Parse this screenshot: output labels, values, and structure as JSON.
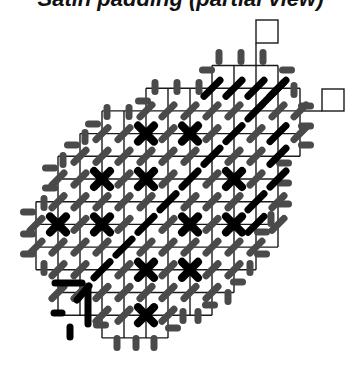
{
  "title": "Satin padding (partial view)",
  "colors": {
    "grid_line": "#1a1a1a",
    "grey_stitch": "#4a4a4a",
    "black_stitch": "#000000",
    "background": "#ffffff"
  },
  "grid": {
    "x0": 36,
    "col_w": 22,
    "y0": 65.5,
    "row_h": 22.7,
    "rows": [
      {
        "c0": 8,
        "c1": 11
      },
      {
        "c0": 5,
        "c1": 12
      },
      {
        "c0": 3,
        "c1": 12
      },
      {
        "c0": 2,
        "c1": 12
      },
      {
        "c0": 1,
        "c1": 11
      },
      {
        "c0": 1,
        "c1": 11
      },
      {
        "c0": 0,
        "c1": 11
      },
      {
        "c0": 0,
        "c1": 11
      },
      {
        "c0": 0,
        "c1": 10
      },
      {
        "c0": 1,
        "c1": 9
      },
      {
        "c0": 1,
        "c1": 8
      },
      {
        "c0": 3,
        "c1": 6
      }
    ]
  },
  "flags": [
    {
      "name": "flag-box-top",
      "x": 256,
      "y": 20,
      "w": 22,
      "h": 23,
      "line": [
        256,
        43,
        256,
        65
      ]
    },
    {
      "name": "flag-box-right",
      "x": 322,
      "y": 89,
      "w": 22,
      "h": 22,
      "line": [
        300,
        111,
        322,
        111
      ]
    }
  ],
  "crosses": [
    [
      5,
      3
    ],
    [
      7,
      3
    ],
    [
      3,
      5
    ],
    [
      5,
      5
    ],
    [
      9,
      5
    ],
    [
      1,
      7
    ],
    [
      3,
      7
    ],
    [
      7,
      7
    ],
    [
      9,
      7
    ],
    [
      5,
      9
    ],
    [
      7,
      9
    ],
    [
      5,
      11
    ]
  ],
  "black_slashes": [
    [
      8,
      1
    ],
    [
      9,
      1
    ],
    [
      10,
      1
    ],
    [
      11,
      1
    ],
    [
      9,
      3
    ],
    [
      11,
      3
    ],
    [
      8,
      4
    ],
    [
      11,
      4
    ],
    [
      7,
      5
    ],
    [
      11,
      5
    ],
    [
      6,
      6
    ],
    [
      10,
      6
    ],
    [
      5,
      7
    ],
    [
      10,
      7
    ],
    [
      4,
      8
    ],
    [
      3,
      9
    ]
  ],
  "long_black_diagonal": [
    [
      10,
      2
    ],
    [
      11,
      1
    ]
  ],
  "hook_mark": {
    "horizontal": [
      [
        55,
        283
      ],
      [
        82,
        283
      ]
    ],
    "diagonal": [
      [
        77,
        300
      ],
      [
        89,
        286
      ]
    ],
    "vertical": [
      [
        88,
        288
      ],
      [
        88,
        324
      ]
    ],
    "short_dash": [
      [
        54,
        313
      ],
      [
        62,
        313
      ]
    ],
    "short_vert": [
      [
        70,
        327
      ],
      [
        70,
        337
      ]
    ]
  },
  "edge_stitches": [
    {
      "x": 219,
      "y": 57,
      "o": "v"
    },
    {
      "x": 241,
      "y": 57,
      "o": "v"
    },
    {
      "x": 263,
      "y": 57,
      "o": "v"
    },
    {
      "x": 207,
      "y": 70,
      "o": "h"
    },
    {
      "x": 287,
      "y": 70,
      "o": "h"
    },
    {
      "x": 155,
      "y": 87,
      "o": "v"
    },
    {
      "x": 177,
      "y": 87,
      "o": "v"
    },
    {
      "x": 199,
      "y": 87,
      "o": "v"
    },
    {
      "x": 294,
      "y": 90,
      "o": "v"
    },
    {
      "x": 143,
      "y": 101,
      "o": "h"
    },
    {
      "x": 306,
      "y": 106,
      "o": "h"
    },
    {
      "x": 107,
      "y": 112,
      "o": "v"
    },
    {
      "x": 129,
      "y": 112,
      "o": "v"
    },
    {
      "x": 306,
      "y": 126,
      "o": "h"
    },
    {
      "x": 93,
      "y": 124,
      "o": "h"
    },
    {
      "x": 306,
      "y": 145,
      "o": "h"
    },
    {
      "x": 85,
      "y": 137,
      "o": "v"
    },
    {
      "x": 72,
      "y": 145,
      "o": "h"
    },
    {
      "x": 63,
      "y": 160,
      "o": "v"
    },
    {
      "x": 284,
      "y": 163,
      "o": "h"
    },
    {
      "x": 50,
      "y": 168,
      "o": "h"
    },
    {
      "x": 284,
      "y": 183,
      "o": "h"
    },
    {
      "x": 50,
      "y": 188,
      "o": "h"
    },
    {
      "x": 44,
      "y": 203,
      "o": "v"
    },
    {
      "x": 284,
      "y": 204,
      "o": "h"
    },
    {
      "x": 28,
      "y": 212,
      "o": "h"
    },
    {
      "x": 271,
      "y": 219,
      "o": "v"
    },
    {
      "x": 28,
      "y": 234,
      "o": "h"
    },
    {
      "x": 262,
      "y": 232,
      "o": "h"
    },
    {
      "x": 28,
      "y": 254,
      "o": "h"
    },
    {
      "x": 44,
      "y": 268,
      "o": "v"
    },
    {
      "x": 262,
      "y": 254,
      "o": "h"
    },
    {
      "x": 250,
      "y": 268,
      "o": "v"
    },
    {
      "x": 238,
      "y": 282,
      "o": "h"
    },
    {
      "x": 228,
      "y": 297,
      "o": "v"
    },
    {
      "x": 210,
      "y": 305,
      "o": "h"
    },
    {
      "x": 183,
      "y": 316,
      "o": "v"
    },
    {
      "x": 198,
      "y": 316,
      "o": "v"
    },
    {
      "x": 101,
      "y": 325,
      "o": "h"
    },
    {
      "x": 173,
      "y": 328,
      "o": "h"
    },
    {
      "x": 117,
      "y": 343,
      "o": "v"
    },
    {
      "x": 136,
      "y": 343,
      "o": "v"
    },
    {
      "x": 154,
      "y": 343,
      "o": "v"
    }
  ]
}
